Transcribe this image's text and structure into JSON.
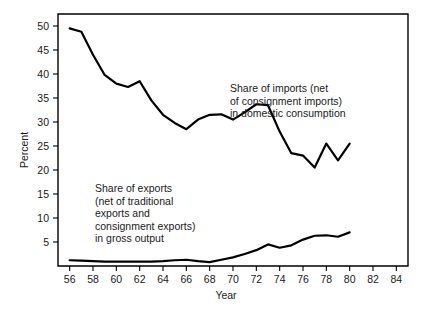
{
  "chart_data": {
    "type": "line",
    "title": "",
    "xlabel": "Year",
    "ylabel": "Percent",
    "xlim": [
      55,
      85
    ],
    "ylim": [
      0,
      52.5
    ],
    "grid": false,
    "legend_position": "inline-annotations",
    "x_ticks": [
      56,
      58,
      60,
      62,
      64,
      66,
      68,
      70,
      72,
      74,
      76,
      78,
      80,
      82,
      84
    ],
    "x_tick_labels": [
      "56",
      "58",
      "60",
      "62",
      "64",
      "66",
      "68",
      "70",
      "72",
      "74",
      "76",
      "78",
      "80",
      "82",
      "84"
    ],
    "y_ticks": [
      5,
      10,
      15,
      20,
      25,
      30,
      35,
      40,
      45,
      50
    ],
    "y_tick_labels": [
      "5",
      "10",
      "15",
      "20",
      "25",
      "30",
      "35",
      "40",
      "45",
      "50"
    ],
    "x": [
      1956,
      1957,
      1958,
      1959,
      1960,
      1961,
      1962,
      1963,
      1964,
      1965,
      1966,
      1967,
      1968,
      1969,
      1970,
      1971,
      1972,
      1973,
      1974,
      1975,
      1976,
      1977,
      1978,
      1979,
      1980
    ],
    "series": [
      {
        "name": "Share of imports (net of consignment imports) in domestic consumption",
        "values": [
          49.5,
          48.8,
          44.0,
          39.8,
          38.0,
          37.3,
          38.5,
          34.5,
          31.5,
          29.8,
          28.5,
          30.5,
          31.5,
          31.6,
          30.5,
          32.0,
          33.7,
          33.5,
          28.0,
          23.5,
          23.0,
          20.5,
          25.5,
          22.0,
          25.5
        ]
      },
      {
        "name": "Share of exports (net of traditional exports and consignment exports) in gross output",
        "values": [
          1.2,
          1.1,
          1.0,
          0.9,
          0.9,
          0.9,
          0.9,
          0.9,
          1.0,
          1.2,
          1.3,
          1.0,
          0.8,
          1.3,
          1.8,
          2.5,
          3.3,
          4.5,
          3.8,
          4.3,
          5.5,
          6.3,
          6.4,
          6.1,
          7.0
        ]
      }
    ],
    "annotations": [
      {
        "name": "imports-annotation",
        "lines": [
          "Share of imports (net",
          "of consignment imports)",
          "in domestic consumption"
        ],
        "x_px": 230,
        "y_px": 92
      },
      {
        "name": "exports-annotation",
        "lines": [
          "Share of exports",
          "(net of traditional",
          "exports and",
          "consignment exports)",
          "in gross output"
        ],
        "x_px": 95,
        "y_px": 192
      }
    ]
  }
}
